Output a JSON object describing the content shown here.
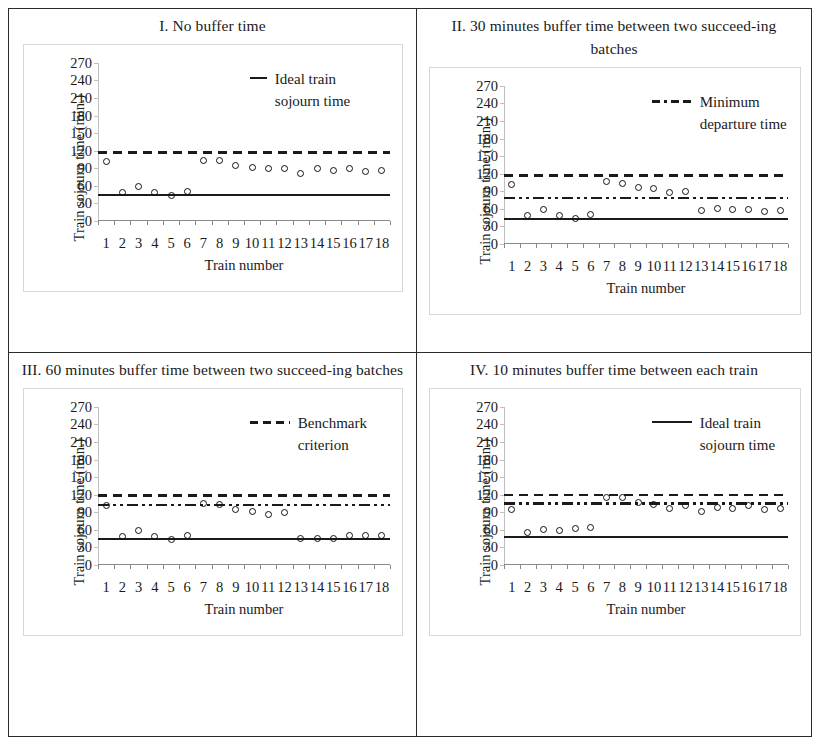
{
  "figure": {
    "axis_y_title": "Train sojourn time (min.)",
    "axis_x_title": "Train number",
    "y_ticks": [
      "0",
      "30",
      "60",
      "90",
      "120",
      "150",
      "180",
      "210",
      "240",
      "270"
    ],
    "x_ticks": [
      "1",
      "2",
      "3",
      "4",
      "5",
      "6",
      "7",
      "8",
      "9",
      "10",
      "11",
      "12",
      "13",
      "14",
      "15",
      "16",
      "17",
      "18"
    ]
  },
  "panels": [
    {
      "title": "I. No buffer time",
      "legend": {
        "label_line1": "Ideal train",
        "label_line2": "sojourn time",
        "style": "solid"
      }
    },
    {
      "title": "II. 30 minutes buffer time between two succeed-ing batches",
      "legend": {
        "label_line1": "Minimum",
        "label_line2": "departure time",
        "style": "dashdotdot"
      }
    },
    {
      "title": "III. 60 minutes buffer time between two succeed-ing batches",
      "legend": {
        "label_line1": "Benchmark",
        "label_line2": "criterion",
        "style": "dashed"
      }
    },
    {
      "title": "IV. 10 minutes buffer time between each train",
      "legend": {
        "label_line1": "Ideal train",
        "label_line2": "sojourn time",
        "style": "solid"
      }
    }
  ],
  "chart_data": [
    {
      "type": "scatter",
      "title": "I. No buffer time",
      "xlabel": "Train number",
      "ylabel": "Train sojourn time (min.)",
      "ylim": [
        0,
        270
      ],
      "xlim": [
        1,
        18
      ],
      "grid": false,
      "legend_position": "top-right",
      "categories": [
        1,
        2,
        3,
        4,
        5,
        6,
        7,
        8,
        9,
        10,
        11,
        12,
        13,
        14,
        15,
        16,
        17,
        18
      ],
      "series": [
        {
          "name": "Train sojourn time",
          "marker": "open-circle",
          "values": [
            101,
            48,
            59,
            48,
            44,
            50,
            104,
            104,
            94,
            91,
            89,
            89,
            81,
            89,
            87,
            89,
            84,
            87
          ]
        },
        {
          "name": "Ideal train sojourn time",
          "type": "hline",
          "style": "solid",
          "value": 46
        },
        {
          "name": "Benchmark criterion",
          "type": "hline",
          "style": "dashed",
          "value": 119
        }
      ]
    },
    {
      "type": "scatter",
      "title": "II. 30 minutes buffer time between two succeeding batches",
      "xlabel": "Train number",
      "ylabel": "Train sojourn time (min.)",
      "ylim": [
        0,
        270
      ],
      "xlim": [
        1,
        18
      ],
      "grid": false,
      "legend_position": "top-right",
      "categories": [
        1,
        2,
        3,
        4,
        5,
        6,
        7,
        8,
        9,
        10,
        11,
        12,
        13,
        14,
        15,
        16,
        17,
        18
      ],
      "series": [
        {
          "name": "Train sojourn time",
          "marker": "open-circle",
          "values": [
            101,
            49,
            59,
            49,
            44,
            51,
            107,
            104,
            96,
            94,
            87,
            89,
            57,
            61,
            59,
            58,
            55,
            57
          ]
        },
        {
          "name": "Ideal train sojourn time",
          "type": "hline",
          "style": "solid",
          "value": 44
        },
        {
          "name": "Minimum departure time",
          "type": "hline",
          "style": "dashdotdot",
          "value": 80
        },
        {
          "name": "Benchmark criterion",
          "type": "hline",
          "style": "dashed",
          "value": 119
        }
      ]
    },
    {
      "type": "scatter",
      "title": "III. 60 minutes buffer time between two succeeding batches",
      "xlabel": "Train number",
      "ylabel": "Train sojourn time (min.)",
      "ylim": [
        0,
        270
      ],
      "xlim": [
        1,
        18
      ],
      "grid": false,
      "legend_position": "top-right",
      "categories": [
        1,
        2,
        3,
        4,
        5,
        6,
        7,
        8,
        9,
        10,
        11,
        12,
        13,
        14,
        15,
        16,
        17,
        18
      ],
      "series": [
        {
          "name": "Train sojourn time",
          "marker": "open-circle",
          "values": [
            101,
            49,
            59,
            48,
            44,
            50,
            105,
            104,
            95,
            92,
            87,
            89,
            45,
            45,
            46,
            51,
            51,
            50
          ]
        },
        {
          "name": "Ideal train sojourn time",
          "type": "hline",
          "style": "solid",
          "value": 46
        },
        {
          "name": "Minimum departure time",
          "type": "hline",
          "style": "dashdotdot",
          "value": 104
        },
        {
          "name": "Benchmark criterion",
          "type": "hline",
          "style": "dashed",
          "value": 121
        }
      ]
    },
    {
      "type": "scatter",
      "title": "IV. 10 minutes buffer time between each train",
      "xlabel": "Train number",
      "ylabel": "Train sojourn time (min.)",
      "ylim": [
        0,
        270
      ],
      "xlim": [
        1,
        18
      ],
      "grid": false,
      "legend_position": "top-right",
      "categories": [
        1,
        2,
        3,
        4,
        5,
        6,
        7,
        8,
        9,
        10,
        11,
        12,
        13,
        14,
        15,
        16,
        17,
        18
      ],
      "series": [
        {
          "name": "Train sojourn time",
          "marker": "open-circle",
          "values": [
            94,
            55,
            61,
            59,
            62,
            64,
            115,
            116,
            106,
            104,
            96,
            101,
            92,
            98,
            96,
            101,
            95,
            97
          ]
        },
        {
          "name": "Ideal train sojourn time",
          "type": "hline",
          "style": "solid",
          "value": 50
        },
        {
          "name": "Minimum departure time",
          "type": "hline",
          "style": "dashdotdot",
          "value": 107
        },
        {
          "name": "Benchmark criterion",
          "type": "hline",
          "style": "dashed",
          "value": 122
        }
      ]
    }
  ]
}
